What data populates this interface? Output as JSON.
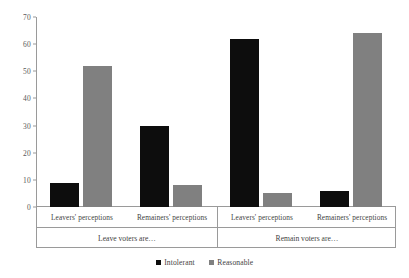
{
  "chart_data": {
    "type": "bar",
    "title": "",
    "xlabel": "",
    "ylabel": "",
    "ylim": [
      0,
      70
    ],
    "ytick_step": 10,
    "yticks": [
      0,
      10,
      20,
      30,
      40,
      50,
      60,
      70
    ],
    "grid": false,
    "legend_position": "bottom-center",
    "categories": [
      "Leavers' perceptions",
      "Remainers' perceptions",
      "Leavers' perceptions",
      "Remainers' perceptions"
    ],
    "groups": [
      {
        "label": "Leave voters are…",
        "categories": [
          "Leavers' perceptions",
          "Remainers' perceptions"
        ]
      },
      {
        "label": "Remain voters are…",
        "categories": [
          "Leavers' perceptions",
          "Remainers' perceptions"
        ]
      }
    ],
    "series": [
      {
        "name": "Intolerant",
        "color": "#0d0d0d",
        "values": [
          9,
          30,
          62,
          6
        ]
      },
      {
        "name": "Reasonable",
        "color": "#808080",
        "values": [
          52,
          8,
          5,
          64
        ]
      }
    ]
  },
  "legend": {
    "items": [
      {
        "label": "Intolerant",
        "color": "#0d0d0d"
      },
      {
        "label": "Reasonable",
        "color": "#808080"
      }
    ]
  },
  "axis": {
    "y_tick_labels": [
      "0",
      "10",
      "20",
      "30",
      "40",
      "50",
      "60",
      "70"
    ]
  }
}
